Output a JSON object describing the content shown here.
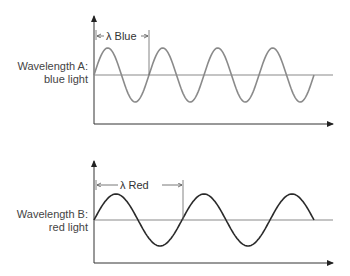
{
  "panels": [
    {
      "id": "A",
      "label_line1": "Wavelength A:",
      "label_line2": "blue light",
      "lambda_label": "λ Blue",
      "wave_color": "#8a8a8a",
      "cycles": 4,
      "wavelength_px": 55,
      "amplitude_px": 27
    },
    {
      "id": "B",
      "label_line1": "Wavelength B:",
      "label_line2": "red light",
      "lambda_label": "λ Red",
      "wave_color": "#2a2a2a",
      "cycles": 2.5,
      "wavelength_px": 88,
      "amplitude_px": 26
    }
  ],
  "colors": {
    "axis": "#333333",
    "centerline": "#8a8a8a",
    "text": "#444444"
  }
}
